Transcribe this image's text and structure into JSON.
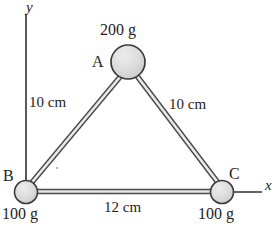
{
  "figure": {
    "background": "#ffffff",
    "ink_color": "#1d1d1d",
    "node_fill": "#dcdcdc",
    "node_stroke": "#3a3a3a",
    "rod_color": "#4a4a4a"
  },
  "axes": {
    "y_label": "y",
    "x_label": "x",
    "y_line": {
      "x": 26,
      "y_top": 14,
      "y_bottom": 192
    },
    "x_line": {
      "y": 192,
      "x_left": 222,
      "x_right": 262
    }
  },
  "nodes": [
    {
      "id": "A",
      "label": "A",
      "mass": "200 g",
      "cx": 128,
      "cy": 62,
      "r": 17
    },
    {
      "id": "B",
      "label": "B",
      "mass": "100 g",
      "cx": 26,
      "cy": 192,
      "r": 11.5
    },
    {
      "id": "C",
      "label": "C",
      "mass": "100 g",
      "cx": 222,
      "cy": 192,
      "r": 11.5
    }
  ],
  "rods": [
    {
      "id": "AB",
      "from": "A",
      "to": "B",
      "length_label": "10 cm"
    },
    {
      "id": "AC",
      "from": "A",
      "to": "C",
      "length_label": "10 cm"
    },
    {
      "id": "BC",
      "from": "B",
      "to": "C",
      "length_label": "12 cm"
    }
  ]
}
